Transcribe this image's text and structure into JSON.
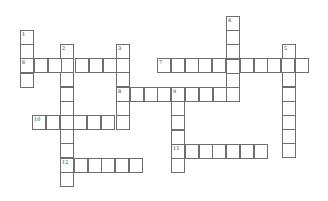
{
  "puzzle": {
    "type": "crossword",
    "cell_width": 13.8,
    "cell_height": 14.2,
    "words": [
      {
        "number": "1",
        "direction": "down",
        "x": 20,
        "y": 30,
        "length": 4
      },
      {
        "number": "2",
        "direction": "down",
        "x": 60,
        "y": 44,
        "length": 10
      },
      {
        "number": "3",
        "direction": "down",
        "x": 116,
        "y": 44,
        "length": 6
      },
      {
        "number": "4",
        "direction": "down",
        "x": 226,
        "y": 16,
        "length": 6
      },
      {
        "number": "5",
        "direction": "down",
        "x": 282,
        "y": 44,
        "length": 8
      },
      {
        "number": "6",
        "direction": "across",
        "x": 20,
        "y": 58,
        "length": 8
      },
      {
        "number": "7",
        "direction": "across",
        "x": 157,
        "y": 58,
        "length": 11
      },
      {
        "number": "8",
        "direction": "across",
        "x": 116,
        "y": 87,
        "length": 9
      },
      {
        "number": "9",
        "direction": "down",
        "x": 171,
        "y": 87,
        "length": 6
      },
      {
        "number": "10",
        "direction": "across",
        "x": 32,
        "y": 115,
        "length": 7
      },
      {
        "number": "11",
        "direction": "across",
        "x": 171,
        "y": 144,
        "length": 7
      },
      {
        "number": "12",
        "direction": "across",
        "x": 60,
        "y": 158,
        "length": 6
      }
    ]
  }
}
